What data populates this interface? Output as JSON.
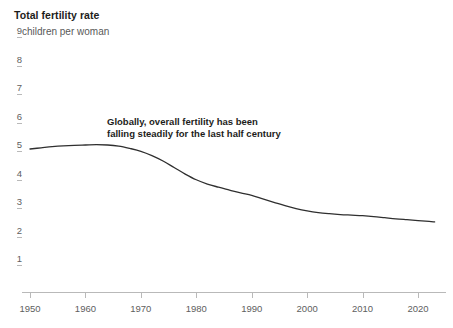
{
  "header": {
    "title": "Total fertility rate",
    "subtitle": "children per woman"
  },
  "annotation": {
    "text": "Globally, overall fertility has been\nfalling steadily for the last half century"
  },
  "colors": {
    "line": "#2f2f2f",
    "axis": "#b9b9b9",
    "tick_text": "#606060",
    "title_text": "#1d1d1b",
    "subtitle_text": "#595959",
    "background": "#ffffff"
  },
  "chart_data": {
    "type": "line",
    "title": "Total fertility rate",
    "subtitle": "children per woman",
    "xlabel": "",
    "ylabel": "children per woman",
    "xlim": [
      1950,
      2023
    ],
    "ylim": [
      0,
      9
    ],
    "grid": false,
    "legend": "none",
    "x_ticks": [
      1950,
      1960,
      1970,
      1980,
      1990,
      2000,
      2010,
      2020
    ],
    "y_ticks": [
      1,
      2,
      3,
      4,
      5,
      6,
      7,
      8,
      9
    ],
    "annotations": [
      {
        "text": "Globally, overall fertility has been falling steadily for the last half century",
        "x": 1964,
        "y": 5.6
      }
    ],
    "series": [
      {
        "name": "World",
        "x": [
          1950,
          1952,
          1954,
          1956,
          1958,
          1960,
          1962,
          1964,
          1966,
          1968,
          1970,
          1972,
          1974,
          1976,
          1978,
          1980,
          1982,
          1984,
          1986,
          1988,
          1990,
          1992,
          1994,
          1996,
          1998,
          2000,
          2002,
          2004,
          2006,
          2008,
          2010,
          2012,
          2014,
          2016,
          2018,
          2020,
          2022,
          2023
        ],
        "values": [
          4.86,
          4.9,
          4.94,
          4.97,
          4.99,
          5.0,
          5.01,
          5.0,
          4.96,
          4.88,
          4.78,
          4.63,
          4.44,
          4.21,
          3.98,
          3.78,
          3.63,
          3.52,
          3.42,
          3.32,
          3.23,
          3.11,
          2.99,
          2.87,
          2.77,
          2.69,
          2.63,
          2.59,
          2.56,
          2.54,
          2.52,
          2.49,
          2.45,
          2.41,
          2.38,
          2.35,
          2.32,
          2.3
        ]
      }
    ]
  }
}
